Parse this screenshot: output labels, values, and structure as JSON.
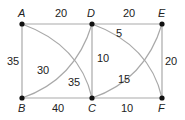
{
  "diagram": {
    "type": "weighted-graph",
    "nodes": [
      {
        "id": "A",
        "label": "A",
        "x": 22,
        "y": 24
      },
      {
        "id": "D",
        "label": "D",
        "x": 92,
        "y": 24
      },
      {
        "id": "E",
        "label": "E",
        "x": 162,
        "y": 24
      },
      {
        "id": "B",
        "label": "B",
        "x": 22,
        "y": 98
      },
      {
        "id": "C",
        "label": "C",
        "x": 92,
        "y": 98
      },
      {
        "id": "F",
        "label": "F",
        "x": 162,
        "y": 98
      }
    ],
    "edges": [
      {
        "from": "A",
        "to": "D",
        "weight": "20",
        "shape": "straight"
      },
      {
        "from": "D",
        "to": "E",
        "weight": "20",
        "shape": "straight"
      },
      {
        "from": "A",
        "to": "B",
        "weight": "35",
        "shape": "straight"
      },
      {
        "from": "B",
        "to": "C",
        "weight": "40",
        "shape": "straight"
      },
      {
        "from": "C",
        "to": "F",
        "weight": "10",
        "shape": "straight"
      },
      {
        "from": "D",
        "to": "C",
        "weight": "10",
        "shape": "straight"
      },
      {
        "from": "E",
        "to": "F",
        "weight": "20",
        "shape": "straight"
      },
      {
        "from": "A",
        "to": "C",
        "weight": "35",
        "shape": "curved"
      },
      {
        "from": "B",
        "to": "D",
        "weight": "30",
        "shape": "curved"
      },
      {
        "from": "D",
        "to": "F",
        "weight": "5",
        "shape": "curved"
      },
      {
        "from": "C",
        "to": "E",
        "weight": "15",
        "shape": "curved"
      }
    ]
  },
  "colors": {
    "edge": "#a9a9a9",
    "node": "#111111",
    "text": "#222222"
  }
}
